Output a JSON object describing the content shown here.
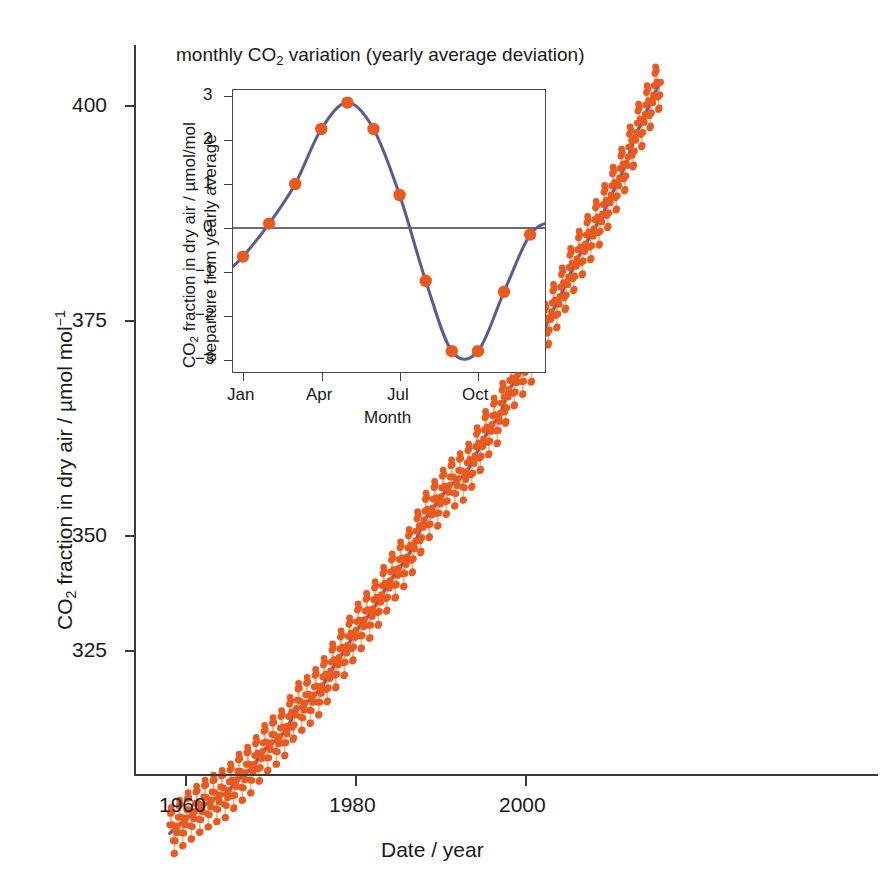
{
  "figure": {
    "background": "#ffffff",
    "marker_color": "#ea5a1e",
    "line_color": "#5a5a96",
    "axis_color": "#3b3b3b"
  },
  "main": {
    "xlabel": "Date / year",
    "ylabel_prefix": "CO",
    "ylabel_sub": "2",
    "ylabel_rest": " fraction in dry air / µmol mol",
    "ylabel_sup": "−1",
    "xticks": [
      "1960",
      "1980",
      "2000"
    ],
    "yticks": [
      "400",
      "375",
      "350",
      "325"
    ]
  },
  "inset": {
    "title_prefix": "monthly CO",
    "title_sub": "2",
    "title_rest": " variation (yearly average deviation)",
    "xlabel": "Month",
    "ylabel_line1_prefix": "CO",
    "ylabel_line1_sub": "2",
    "ylabel_line1_rest": " fraction in dry air / µmol/mol",
    "ylabel_line2": "departure from yearly average",
    "xticks": [
      "Jan",
      "Apr",
      "Jul",
      "Oct"
    ],
    "yticks": [
      "3",
      "2",
      "1",
      "0",
      "−1",
      "−2",
      "−3"
    ]
  },
  "chart_data": [
    {
      "type": "scatter",
      "name": "main-keeling-curve",
      "title": "",
      "xlabel": "Date / year",
      "ylabel": "CO2 fraction in dry air / umol mol^-1",
      "xlim": [
        1957.0,
        2016.5
      ],
      "ylim": [
        310,
        406
      ],
      "xticks": [
        1960,
        1980,
        2000
      ],
      "yticks": [
        325,
        350,
        375,
        400
      ],
      "grid": false,
      "legend": "none",
      "series": [
        {
          "name": "monthly mean CO2 (orange markers)",
          "marker": "circle",
          "color": "#ea5a1e",
          "note": "monthly values = annual trend + seasonal cycle of amplitude ~3 umol/mol",
          "x": [
            1958.2,
            1959,
            1960,
            1961,
            1962,
            1963,
            1964,
            1965,
            1966,
            1967,
            1968,
            1969,
            1970,
            1971,
            1972,
            1973,
            1974,
            1975,
            1976,
            1977,
            1978,
            1979,
            1980,
            1981,
            1982,
            1983,
            1984,
            1985,
            1986,
            1987,
            1988,
            1989,
            1990,
            1991,
            1992,
            1993,
            1994,
            1995,
            1996,
            1997,
            1998,
            1999,
            2000,
            2001,
            2002,
            2003,
            2004,
            2005,
            2006,
            2007,
            2008,
            2009,
            2010,
            2011,
            2012,
            2013,
            2014,
            2015,
            2016
          ],
          "y": [
            315.3,
            315.98,
            316.91,
            317.64,
            318.45,
            318.99,
            319.62,
            320.04,
            321.38,
            322.16,
            323.04,
            324.62,
            325.68,
            326.32,
            327.45,
            329.68,
            330.25,
            331.15,
            332.15,
            333.9,
            335.5,
            336.85,
            338.69,
            339.93,
            341.13,
            342.78,
            344.42,
            345.9,
            347.15,
            348.93,
            351.48,
            352.91,
            354.19,
            355.59,
            356.37,
            357.04,
            358.89,
            360.88,
            362.64,
            363.76,
            366.63,
            368.31,
            369.48,
            371.02,
            373.1,
            375.64,
            377.38,
            379.67,
            381.84,
            383.55,
            385.34,
            386.98,
            389.21,
            391.15,
            393.51,
            396.48,
            398.55,
            400.83,
            402.9
          ]
        },
        {
          "name": "annual trend (blue line)",
          "color": "#5a5a96",
          "x": [
            1958.2,
            1959,
            1960,
            1961,
            1962,
            1963,
            1964,
            1965,
            1966,
            1967,
            1968,
            1969,
            1970,
            1971,
            1972,
            1973,
            1974,
            1975,
            1976,
            1977,
            1978,
            1979,
            1980,
            1981,
            1982,
            1983,
            1984,
            1985,
            1986,
            1987,
            1988,
            1989,
            1990,
            1991,
            1992,
            1993,
            1994,
            1995,
            1996,
            1997,
            1998,
            1999,
            2000,
            2001,
            2002,
            2003,
            2004,
            2005,
            2006,
            2007,
            2008,
            2009,
            2010,
            2011,
            2012,
            2013,
            2014,
            2015,
            2016
          ],
          "y": [
            315.3,
            315.98,
            316.91,
            317.64,
            318.45,
            318.99,
            319.62,
            320.04,
            321.38,
            322.16,
            323.04,
            324.62,
            325.68,
            326.32,
            327.45,
            329.68,
            330.25,
            331.15,
            332.15,
            333.9,
            335.5,
            336.85,
            338.69,
            339.93,
            341.13,
            342.78,
            344.42,
            345.9,
            347.15,
            348.93,
            351.48,
            352.91,
            354.19,
            355.59,
            356.37,
            357.04,
            358.89,
            360.88,
            362.64,
            363.76,
            366.63,
            368.31,
            369.48,
            371.02,
            373.1,
            375.64,
            377.38,
            379.67,
            381.84,
            383.55,
            385.34,
            386.98,
            389.21,
            391.15,
            393.51,
            396.48,
            398.55,
            400.83,
            402.9
          ]
        }
      ]
    },
    {
      "type": "line",
      "name": "inset-monthly-variation",
      "title": "monthly CO2 variation (yearly average deviation)",
      "xlabel": "Month",
      "ylabel": "CO2 fraction in dry air / umol/mol departure from yearly average",
      "categories": [
        "Jan",
        "Feb",
        "Mar",
        "Apr",
        "May",
        "Jun",
        "Jul",
        "Aug",
        "Sep",
        "Oct",
        "Nov",
        "Dec"
      ],
      "values": [
        -0.65,
        0.1,
        1.0,
        2.25,
        2.85,
        2.25,
        0.75,
        -1.2,
        -2.8,
        -2.8,
        -1.45,
        -0.15
      ],
      "xlim": [
        0.5,
        12.5
      ],
      "ylim": [
        -3.4,
        3.2
      ],
      "yticks": [
        3,
        2,
        1,
        0,
        -1,
        -2,
        -3
      ],
      "xticks_shown": [
        "Jan",
        "Apr",
        "Jul",
        "Oct"
      ],
      "grid": false,
      "zero_line": true,
      "marker_color": "#ea5a1e",
      "line_color": "#5a5a96"
    }
  ]
}
